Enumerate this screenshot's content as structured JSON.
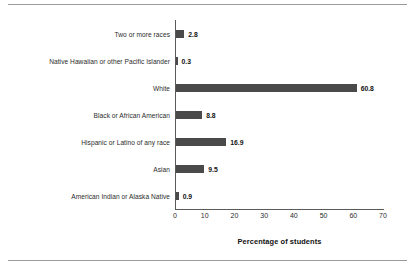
{
  "chart_data": {
    "type": "bar",
    "orientation": "horizontal",
    "title": "",
    "xlabel": "Percentage of students",
    "ylabel": "",
    "xlim": [
      0,
      70
    ],
    "xticks": [
      "0",
      "10",
      "20",
      "30",
      "40",
      "50",
      "60",
      "70"
    ],
    "grid": false,
    "legend": false,
    "bar_color": "#4a4a4a",
    "categories": [
      "Two or more races",
      "Native Hawaiian or other Pacific Islander",
      "White",
      "Black or African American",
      "Hispanic or Latino of any race",
      "Asian",
      "American Indian or Alaska Native"
    ],
    "values": [
      2.8,
      0.3,
      60.8,
      8.8,
      16.9,
      9.5,
      0.9
    ],
    "value_labels": [
      "2.8",
      "0.3",
      "60.8",
      "8.8",
      "16.9",
      "9.5",
      "0.9"
    ]
  }
}
